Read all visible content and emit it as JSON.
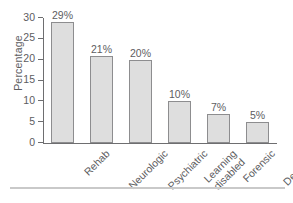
{
  "chart_data": {
    "type": "bar",
    "title": "",
    "xlabel": "",
    "ylabel": "Percentage",
    "ylim": [
      0,
      30
    ],
    "yticks": [
      0,
      5,
      10,
      15,
      20,
      25,
      30
    ],
    "ytick_labels": [
      "0",
      "5",
      "10",
      "15",
      "20",
      "25",
      "30"
    ],
    "grid": false,
    "legend": false,
    "categories": [
      "Rehab",
      "Neurologic",
      "Psychiatric",
      "Learning disabled",
      "Forensic",
      "Dementia"
    ],
    "category_lines": [
      [
        "Rehab"
      ],
      [
        "Neurologic"
      ],
      [
        "Psychiatric"
      ],
      [
        "Learning",
        "disabled"
      ],
      [
        "Forensic"
      ],
      [
        "Dementia"
      ]
    ],
    "values": [
      29,
      21,
      20,
      10,
      7,
      5
    ],
    "data_labels": [
      "29%",
      "21%",
      "20%",
      "10%",
      "7%",
      "5%"
    ],
    "bar_fill": "#dedede",
    "bar_edge": "#8d8d8f",
    "axis_color": "#6e6e70",
    "text_color": "#5d5d5f",
    "background": "#ffffff"
  }
}
